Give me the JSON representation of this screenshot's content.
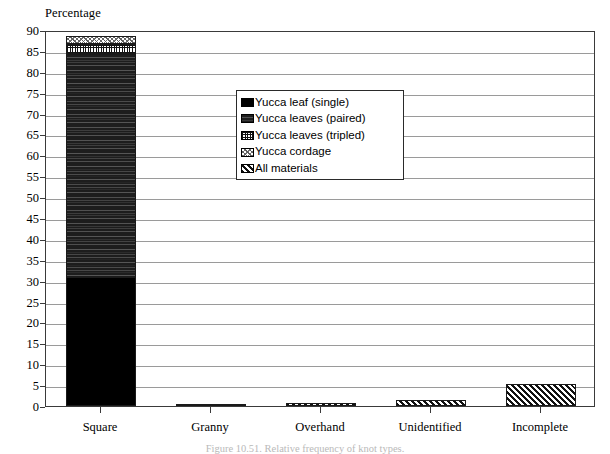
{
  "chart_data": {
    "type": "bar",
    "subtype": "stacked-bar",
    "title": "",
    "caption": "Figure 10.51. Relative frequency of knot types.",
    "ylabel": "Percentage",
    "xlabel": "",
    "ylim": [
      0,
      90
    ],
    "ytick_step": 5,
    "grid": true,
    "legend_position": "inside-top-center",
    "categories": [
      "Square",
      "Granny",
      "Overhand",
      "Unidentified",
      "Incomplete"
    ],
    "yticks": [
      "0",
      "5",
      "10",
      "15",
      "20",
      "25",
      "30",
      "35",
      "40",
      "45",
      "50",
      "55",
      "60",
      "65",
      "70",
      "75",
      "80",
      "85",
      "90"
    ],
    "series": [
      {
        "name": "Yucca leaf (single)",
        "pattern": "solid-black",
        "values": [
          31.0,
          0,
          0,
          0,
          0
        ]
      },
      {
        "name": "Yucca leaves (paired)",
        "pattern": "brick",
        "values": [
          53.2,
          0,
          0,
          0,
          0
        ]
      },
      {
        "name": "Yucca leaves (tripled)",
        "pattern": "fine-grid",
        "values": [
          2.4,
          0,
          0,
          0,
          0
        ]
      },
      {
        "name": "Yucca cordage",
        "pattern": "dots",
        "values": [
          1.9,
          0,
          0,
          0,
          0
        ]
      },
      {
        "name": "All materials",
        "pattern": "diagonal-hatch",
        "values": [
          0,
          0.2,
          0.8,
          1.4,
          5.2
        ]
      }
    ],
    "totals": [
      88.5,
      0.2,
      0.8,
      1.4,
      5.2
    ]
  },
  "legend": {
    "entries": [
      {
        "label": "Yucca leaf (single)",
        "pattern": "solid-black"
      },
      {
        "label": "Yucca leaves (paired)",
        "pattern": "brick"
      },
      {
        "label": "Yucca leaves (tripled)",
        "pattern": "fine-grid"
      },
      {
        "label": "Yucca cordage",
        "pattern": "dots"
      },
      {
        "label": "All materials",
        "pattern": "diagonal-hatch"
      }
    ]
  },
  "colors": {
    "axis": "#3a3a3a",
    "gridline": "#9a9a9a",
    "bar_outline": "#1a1a1a",
    "text": "#000000",
    "background": "#ffffff"
  }
}
